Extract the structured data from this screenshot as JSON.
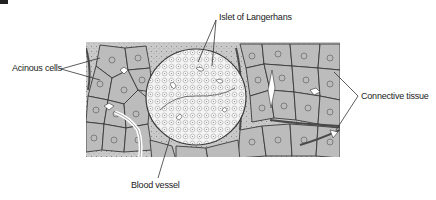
{
  "figure": {
    "labels": {
      "islet": "Islet of Langerhans",
      "acinous": "Acinous cells",
      "connective": "Connective tissue",
      "vessel": "Blood vessel"
    },
    "colors": {
      "background": "#ffffff",
      "tissue_fill": "#cfcfcf",
      "acinar_cell_fill": "#bdbdbd",
      "islet_fill": "#f2f2f2",
      "cell_outline": "#3a3a3a",
      "connective_dark": "#555555",
      "leader_line": "#333333",
      "text": "#222222"
    }
  }
}
